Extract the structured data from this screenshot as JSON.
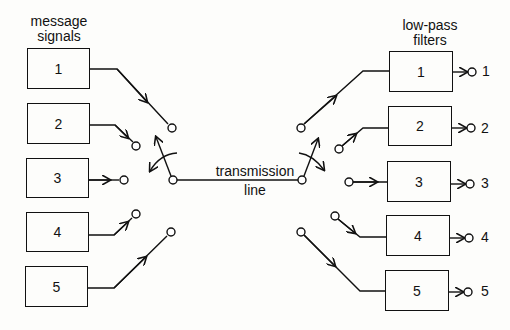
{
  "left_group": {
    "title_line1": "message",
    "title_line2": "signals",
    "boxes": [
      "1",
      "2",
      "3",
      "4",
      "5"
    ]
  },
  "right_group": {
    "title_line1": "low-pass",
    "title_line2": "filters",
    "boxes": [
      "1",
      "2",
      "3",
      "4",
      "5"
    ],
    "outputs": [
      "1",
      "2",
      "3",
      "4",
      "5"
    ]
  },
  "center": {
    "line_label1": "transmission",
    "line_label2": "line"
  },
  "colors": {
    "stroke": "#111111",
    "background": "#fdfdfb"
  }
}
